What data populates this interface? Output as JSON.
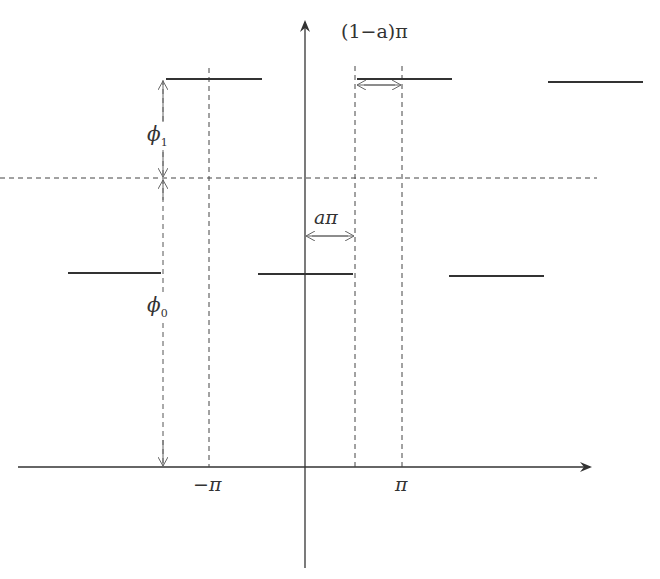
{
  "diagram": {
    "type": "periodic-step-function",
    "labels": {
      "width_upper": "(1−a)π",
      "width_lower": "aπ",
      "phi1_sym": "ϕ",
      "phi1_sub": "1",
      "phi0_sym": "ϕ",
      "phi0_sub": "0",
      "neg_pi": "−π",
      "pi": "π"
    },
    "colors": {
      "ink": "#333333",
      "dash": "#444444"
    },
    "levels": {
      "high_y": 79,
      "mid_y": 178,
      "low_y": 273,
      "axis_y": 467
    },
    "high_segments": [
      [
        166,
        262
      ],
      [
        357,
        452
      ],
      [
        548,
        643
      ]
    ],
    "low_segments": [
      [
        68,
        161
      ],
      [
        258,
        353
      ],
      [
        449,
        544
      ]
    ]
  }
}
